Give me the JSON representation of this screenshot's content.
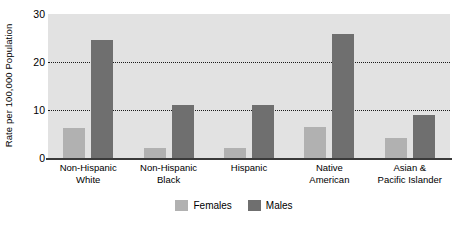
{
  "chart_data": {
    "type": "bar",
    "title": "",
    "subtitle": "",
    "xlabel": "",
    "ylabel": "Rate per 100,000 Population",
    "ylim": [
      0,
      30
    ],
    "yticks": [
      0,
      10,
      20,
      30
    ],
    "ytick_labels": [
      "0",
      "10",
      "20",
      "30"
    ],
    "gridlines": [
      10,
      20
    ],
    "grid": true,
    "grid_style": "dotted",
    "legend_position": "bottom-center",
    "categories": [
      "Non-Hispanic White",
      "Non-Hispanic Black",
      "Hispanic",
      "Native American",
      "Asian & Pacific Islander"
    ],
    "category_lines": [
      [
        "Non-Hispanic",
        "White"
      ],
      [
        "Non-Hispanic",
        "Black"
      ],
      [
        "Hispanic",
        ""
      ],
      [
        "Native",
        "American"
      ],
      [
        "Asian &",
        "Pacific Islander"
      ]
    ],
    "series": [
      {
        "name": "Females",
        "color": "#b1b1b1",
        "values": [
          6.2,
          2.0,
          2.0,
          6.4,
          4.1
        ]
      },
      {
        "name": "Males",
        "color": "#6f6f6f",
        "values": [
          24.6,
          11.0,
          11.0,
          25.8,
          9.0
        ]
      }
    ],
    "plot_background": "#e2e2e2",
    "axis_color": "#3a3a3a"
  }
}
